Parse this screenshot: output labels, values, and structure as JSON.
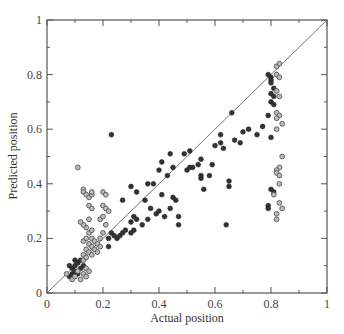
{
  "chart_data": {
    "type": "scatter",
    "title": "",
    "xlabel": "Actual position",
    "ylabel": "Predicted position",
    "xlim": [
      0,
      1
    ],
    "ylim": [
      0,
      1
    ],
    "x_ticks": [
      "0",
      "0.2",
      "0.4",
      "0.6",
      "0.8",
      "1"
    ],
    "y_ticks": [
      "0",
      "0.2",
      "0.4",
      "0.6",
      "0.8",
      "1"
    ],
    "grid": false,
    "legend": null,
    "reference_line": {
      "from": [
        0,
        0
      ],
      "to": [
        1,
        1
      ],
      "label": "y = x"
    },
    "series": [
      {
        "name": "filled",
        "marker": "filled-circle",
        "color": "#333333",
        "points": [
          [
            0.08,
            0.06
          ],
          [
            0.09,
            0.07
          ],
          [
            0.09,
            0.09
          ],
          [
            0.1,
            0.08
          ],
          [
            0.1,
            0.1
          ],
          [
            0.11,
            0.11
          ],
          [
            0.11,
            0.07
          ],
          [
            0.12,
            0.09
          ],
          [
            0.12,
            0.12
          ],
          [
            0.08,
            0.1
          ],
          [
            0.1,
            0.12
          ],
          [
            0.13,
            0.1
          ],
          [
            0.22,
            0.2
          ],
          [
            0.23,
            0.22
          ],
          [
            0.24,
            0.21
          ],
          [
            0.25,
            0.2
          ],
          [
            0.26,
            0.21
          ],
          [
            0.27,
            0.22
          ],
          [
            0.22,
            0.17
          ],
          [
            0.28,
            0.23
          ],
          [
            0.3,
            0.22
          ],
          [
            0.31,
            0.23
          ],
          [
            0.3,
            0.26
          ],
          [
            0.31,
            0.28
          ],
          [
            0.32,
            0.27
          ],
          [
            0.34,
            0.25
          ],
          [
            0.36,
            0.27
          ],
          [
            0.35,
            0.34
          ],
          [
            0.3,
            0.39
          ],
          [
            0.27,
            0.34
          ],
          [
            0.32,
            0.37
          ],
          [
            0.37,
            0.31
          ],
          [
            0.39,
            0.29
          ],
          [
            0.4,
            0.3
          ],
          [
            0.42,
            0.28
          ],
          [
            0.44,
            0.31
          ],
          [
            0.38,
            0.4
          ],
          [
            0.4,
            0.45
          ],
          [
            0.43,
            0.43
          ],
          [
            0.45,
            0.46
          ],
          [
            0.41,
            0.36
          ],
          [
            0.45,
            0.35
          ],
          [
            0.46,
            0.34
          ],
          [
            0.47,
            0.28
          ],
          [
            0.47,
            0.25
          ],
          [
            0.5,
            0.45
          ],
          [
            0.51,
            0.46
          ],
          [
            0.52,
            0.46
          ],
          [
            0.49,
            0.51
          ],
          [
            0.51,
            0.52
          ],
          [
            0.54,
            0.47
          ],
          [
            0.55,
            0.49
          ],
          [
            0.55,
            0.43
          ],
          [
            0.55,
            0.42
          ],
          [
            0.56,
            0.38
          ],
          [
            0.58,
            0.43
          ],
          [
            0.59,
            0.47
          ],
          [
            0.6,
            0.54
          ],
          [
            0.62,
            0.55
          ],
          [
            0.63,
            0.53
          ],
          [
            0.64,
            0.25
          ],
          [
            0.65,
            0.41
          ],
          [
            0.65,
            0.39
          ],
          [
            0.67,
            0.56
          ],
          [
            0.69,
            0.55
          ],
          [
            0.7,
            0.59
          ],
          [
            0.72,
            0.6
          ],
          [
            0.75,
            0.58
          ],
          [
            0.77,
            0.61
          ],
          [
            0.36,
            0.4
          ],
          [
            0.41,
            0.48
          ],
          [
            0.62,
            0.58
          ],
          [
            0.66,
            0.66
          ],
          [
            0.23,
            0.58
          ],
          [
            0.44,
            0.51
          ],
          [
            0.79,
            0.8
          ],
          [
            0.8,
            0.79
          ],
          [
            0.8,
            0.78
          ],
          [
            0.8,
            0.77
          ],
          [
            0.81,
            0.75
          ],
          [
            0.8,
            0.73
          ],
          [
            0.81,
            0.72
          ],
          [
            0.8,
            0.7
          ],
          [
            0.81,
            0.69
          ],
          [
            0.79,
            0.65
          ],
          [
            0.8,
            0.57
          ],
          [
            0.79,
            0.32
          ],
          [
            0.79,
            0.31
          ],
          [
            0.8,
            0.38
          ],
          [
            0.81,
            0.37
          ]
        ]
      },
      {
        "name": "open",
        "marker": "open-circle",
        "color": "#555555",
        "points": [
          [
            0.07,
            0.07
          ],
          [
            0.09,
            0.05
          ],
          [
            0.1,
            0.06
          ],
          [
            0.11,
            0.08
          ],
          [
            0.12,
            0.05
          ],
          [
            0.13,
            0.07
          ],
          [
            0.14,
            0.06
          ],
          [
            0.14,
            0.09
          ],
          [
            0.15,
            0.08
          ],
          [
            0.13,
            0.12
          ],
          [
            0.13,
            0.14
          ],
          [
            0.14,
            0.13
          ],
          [
            0.14,
            0.16
          ],
          [
            0.15,
            0.15
          ],
          [
            0.15,
            0.18
          ],
          [
            0.16,
            0.14
          ],
          [
            0.16,
            0.17
          ],
          [
            0.16,
            0.2
          ],
          [
            0.17,
            0.16
          ],
          [
            0.17,
            0.19
          ],
          [
            0.18,
            0.15
          ],
          [
            0.18,
            0.18
          ],
          [
            0.19,
            0.17
          ],
          [
            0.13,
            0.19
          ],
          [
            0.14,
            0.2
          ],
          [
            0.15,
            0.22
          ],
          [
            0.16,
            0.23
          ],
          [
            0.14,
            0.24
          ],
          [
            0.13,
            0.25
          ],
          [
            0.15,
            0.27
          ],
          [
            0.12,
            0.26
          ],
          [
            0.11,
            0.46
          ],
          [
            0.13,
            0.38
          ],
          [
            0.13,
            0.37
          ],
          [
            0.14,
            0.36
          ],
          [
            0.15,
            0.35
          ],
          [
            0.16,
            0.36
          ],
          [
            0.16,
            0.37
          ],
          [
            0.15,
            0.32
          ],
          [
            0.16,
            0.31
          ],
          [
            0.2,
            0.37
          ],
          [
            0.21,
            0.36
          ],
          [
            0.2,
            0.32
          ],
          [
            0.21,
            0.31
          ],
          [
            0.22,
            0.3
          ],
          [
            0.19,
            0.27
          ],
          [
            0.2,
            0.28
          ],
          [
            0.21,
            0.25
          ],
          [
            0.2,
            0.22
          ],
          [
            0.19,
            0.2
          ],
          [
            0.82,
            0.83
          ],
          [
            0.83,
            0.84
          ],
          [
            0.82,
            0.8
          ],
          [
            0.83,
            0.79
          ],
          [
            0.82,
            0.74
          ],
          [
            0.83,
            0.72
          ],
          [
            0.82,
            0.66
          ],
          [
            0.83,
            0.65
          ],
          [
            0.82,
            0.64
          ],
          [
            0.84,
            0.62
          ],
          [
            0.82,
            0.6
          ],
          [
            0.84,
            0.5
          ],
          [
            0.83,
            0.46
          ],
          [
            0.82,
            0.45
          ],
          [
            0.82,
            0.44
          ],
          [
            0.83,
            0.43
          ],
          [
            0.83,
            0.4
          ],
          [
            0.81,
            0.36
          ],
          [
            0.83,
            0.33
          ],
          [
            0.82,
            0.29
          ],
          [
            0.84,
            0.31
          ],
          [
            0.82,
            0.27
          ]
        ]
      }
    ]
  }
}
